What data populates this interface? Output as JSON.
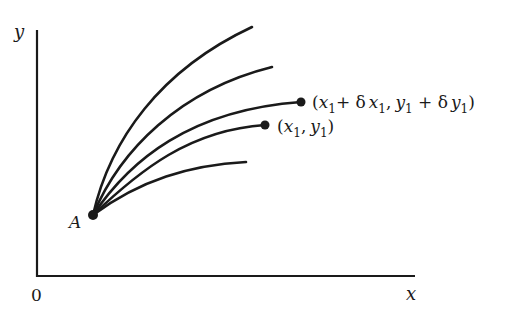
{
  "diagram": {
    "type": "family of curves from a common point",
    "axes": {
      "x_label": "x",
      "y_label": "y",
      "origin_label": "0"
    },
    "point_a": {
      "label": "A"
    },
    "curves": [
      {
        "name": "curve-1",
        "end_marker": false
      },
      {
        "name": "curve-2",
        "end_marker": false
      },
      {
        "name": "curve-3",
        "end_marker": true,
        "end_label": "(x1 + δx1, y1 + δy1)"
      },
      {
        "name": "curve-4",
        "end_marker": true,
        "end_label": "(x1, y1)"
      },
      {
        "name": "curve-5",
        "end_marker": false
      }
    ],
    "labels": {
      "perturbed_point": {
        "open": "(",
        "x": "x",
        "sub1": "1",
        "plus1": "+ δ",
        "x2": "x",
        "sub2": "1",
        "comma": ",",
        "y": "y",
        "sub3": "1",
        "plus2": " + δ",
        "y2": "y",
        "sub4": "1",
        "close": ")"
      },
      "point": {
        "open": "(",
        "x": "x",
        "sub1": "1",
        "comma": ",",
        "y": "y",
        "sub2": "1",
        "close": ")"
      }
    },
    "colors": {
      "ink": "#1a1a1a",
      "background": "#ffffff"
    }
  }
}
